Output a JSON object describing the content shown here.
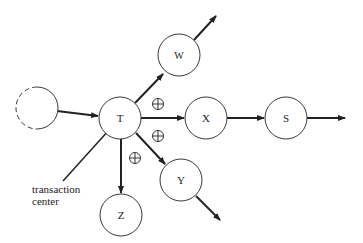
{
  "diagram": {
    "type": "transaction-flow-graph",
    "nodes": [
      {
        "id": "source",
        "label": "",
        "style": "dashed",
        "cx": 37,
        "cy": 108
      },
      {
        "id": "T",
        "label": "T",
        "cx": 120,
        "cy": 118
      },
      {
        "id": "W",
        "label": "W",
        "cx": 179,
        "cy": 55
      },
      {
        "id": "X",
        "label": "X",
        "cx": 206,
        "cy": 118
      },
      {
        "id": "S",
        "label": "S",
        "cx": 286,
        "cy": 118
      },
      {
        "id": "Y",
        "label": "Y",
        "cx": 181,
        "cy": 180
      },
      {
        "id": "Z",
        "label": "Z",
        "cx": 121,
        "cy": 215
      }
    ],
    "edges": [
      {
        "from": "source",
        "to": "T"
      },
      {
        "from": "T",
        "to": "W"
      },
      {
        "from": "T",
        "to": "X"
      },
      {
        "from": "T",
        "to": "Y"
      },
      {
        "from": "T",
        "to": "Z"
      },
      {
        "from": "X",
        "to": "S"
      },
      {
        "from": "W",
        "to": "out"
      },
      {
        "from": "S",
        "to": "out"
      },
      {
        "from": "Y",
        "to": "out"
      }
    ],
    "operator_symbol": "⊕",
    "annotation": {
      "line1": "transaction",
      "line2": "center"
    }
  }
}
